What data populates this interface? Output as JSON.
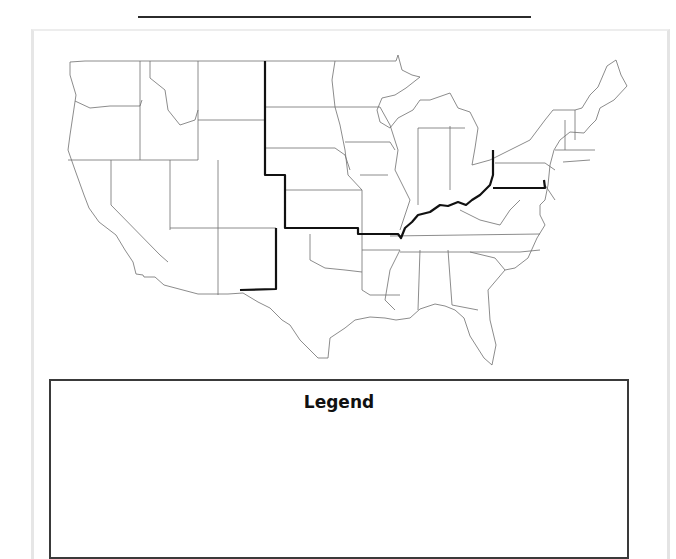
{
  "worksheet": {
    "name_line_label": ""
  },
  "map": {
    "subject": "United States map",
    "boundary_line_color": "#111111",
    "state_line_color": "#666666"
  },
  "legend": {
    "title": "Legend",
    "entries": []
  }
}
